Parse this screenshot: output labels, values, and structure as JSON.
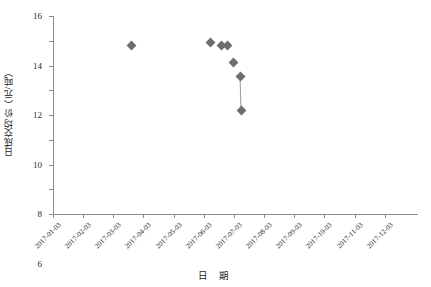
{
  "chart_data": {
    "type": "scatter",
    "title": "",
    "xlabel": "日 期",
    "ylabel": "日成交均价（元/吨）",
    "ylim": [
      0,
      16
    ],
    "yticks": [
      0,
      2,
      4,
      6,
      8,
      10,
      12,
      14,
      16
    ],
    "xticks": [
      "2017-01-03",
      "2017-02-03",
      "2017-03-03",
      "2017-04-03",
      "2017-05-03",
      "2017-06-03",
      "2017-07-03",
      "2017-08-03",
      "2017-09-03",
      "2017-10-03",
      "2017-11-03",
      "2017-12-03"
    ],
    "xlim": [
      "2017-01-03",
      "2017-12-03"
    ],
    "grid": false,
    "legend": "none",
    "marker": "diamond",
    "marker_color": "#6e6e6e",
    "line_color": "#9a9a9a",
    "axis_color": "#8c8c8c",
    "points": [
      {
        "x": "2017-03-19",
        "y": 13.5,
        "px": 131,
        "py": 45,
        "connected_to_next": false
      },
      {
        "x": "2017-06-08",
        "y": 13.8,
        "px": 210,
        "py": 42,
        "connected_to_next": false
      },
      {
        "x": "2017-06-18",
        "y": 13.5,
        "px": 221,
        "py": 45,
        "connected_to_next": false
      },
      {
        "x": "2017-06-21",
        "y": 13.5,
        "px": 227,
        "py": 45,
        "connected_to_next": false
      },
      {
        "x": "2017-06-27",
        "y": 12.5,
        "px": 233,
        "py": 62,
        "connected_to_next": false
      },
      {
        "x": "2017-07-01",
        "y": 11.0,
        "px": 240,
        "py": 76,
        "connected_to_next": true
      },
      {
        "x": "2017-07-04",
        "y": 8.4,
        "px": 241,
        "py": 110,
        "connected_to_next": false
      }
    ]
  }
}
